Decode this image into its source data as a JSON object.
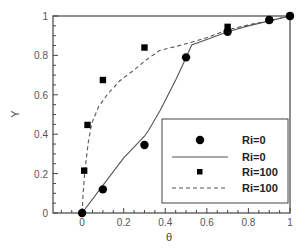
{
  "chart_data": {
    "type": "scatter",
    "title": "",
    "xlabel": "θ",
    "ylabel": "Y",
    "xlim": [
      -0.14,
      1.0
    ],
    "ylim": [
      0,
      1.0
    ],
    "grid": false,
    "xticks": [
      {
        "value": 0,
        "label": "0"
      },
      {
        "value": 0.2,
        "label": "0.2"
      },
      {
        "value": 0.4,
        "label": "0.4"
      },
      {
        "value": 0.6,
        "label": "0.6"
      },
      {
        "value": 0.8,
        "label": "0.8"
      },
      {
        "value": 1,
        "label": "1"
      }
    ],
    "yticks": [
      {
        "value": 0,
        "label": "0"
      },
      {
        "value": 0.2,
        "label": "0.2"
      },
      {
        "value": 0.4,
        "label": "0.4"
      },
      {
        "value": 0.6,
        "label": "0.6"
      },
      {
        "value": 0.8,
        "label": "0.8"
      },
      {
        "value": 1,
        "label": "1"
      }
    ],
    "legend_position": "bottom-right",
    "series": [
      {
        "name": "Ri=0",
        "kind": "markers",
        "marker": "circle",
        "color": "#000000",
        "x": [
          0,
          0.1,
          0.3,
          0.5,
          0.7,
          0.9,
          1.0
        ],
        "y": [
          0,
          0.12,
          0.345,
          0.79,
          0.92,
          0.98,
          1.0
        ]
      },
      {
        "name": "Ri=0",
        "kind": "line",
        "style": "solid",
        "color": "#555555",
        "x": [
          0,
          0.1,
          0.2,
          0.3,
          0.32,
          0.375,
          0.45,
          0.5,
          0.527,
          0.6,
          0.7,
          0.8,
          0.9,
          1.0
        ],
        "y": [
          0,
          0.14,
          0.28,
          0.39,
          0.42,
          0.52,
          0.675,
          0.79,
          0.853,
          0.88,
          0.92,
          0.95,
          0.975,
          1.0
        ]
      },
      {
        "name": "Ri=100",
        "kind": "markers",
        "marker": "square",
        "color": "#000000",
        "x": [
          0.01,
          0.026,
          0.1,
          0.3,
          0.7,
          0.9,
          1.0
        ],
        "y": [
          0.215,
          0.447,
          0.675,
          0.84,
          0.945,
          0.98,
          1.0
        ]
      },
      {
        "name": "Ri=100",
        "kind": "line",
        "style": "dashed",
        "color": "#555555",
        "x": [
          0,
          0.005,
          0.014,
          0.03,
          0.047,
          0.08,
          0.12,
          0.18,
          0.25,
          0.3,
          0.37,
          0.45,
          0.52,
          0.6,
          0.7,
          0.8,
          0.9,
          1.0
        ],
        "y": [
          0,
          0.1,
          0.22,
          0.36,
          0.457,
          0.54,
          0.6,
          0.67,
          0.726,
          0.77,
          0.824,
          0.845,
          0.865,
          0.89,
          0.93,
          0.955,
          0.975,
          1.0
        ]
      }
    ]
  }
}
